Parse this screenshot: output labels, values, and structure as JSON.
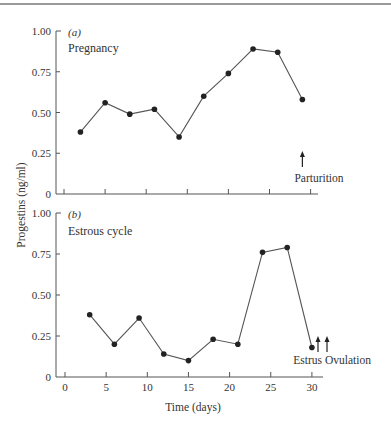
{
  "chart_data": [
    {
      "type": "line",
      "panel_tag": "(a)",
      "title": "Pregnancy",
      "xlabel": "",
      "ylabel": "Progestins (ng/ml)",
      "xlim": [
        0,
        31
      ],
      "ylim": [
        0,
        1.0
      ],
      "x_ticks": [
        0,
        5,
        10,
        15,
        20,
        25,
        30
      ],
      "y_ticks": [
        "0",
        "0.25",
        "0.50",
        "0.75",
        "1.00"
      ],
      "grid": false,
      "x": [
        2,
        5,
        8,
        11,
        14,
        17,
        20,
        23,
        26,
        29
      ],
      "values": [
        0.38,
        0.56,
        0.49,
        0.52,
        0.35,
        0.6,
        0.74,
        0.89,
        0.87,
        0.58
      ],
      "annotations": [
        {
          "label": "Parturition",
          "x": 29,
          "type": "arrow-up"
        }
      ]
    },
    {
      "type": "line",
      "panel_tag": "(b)",
      "title": "Estrous cycle",
      "xlabel": "Time (days)",
      "ylabel": "Progestins (ng/ml)",
      "xlim": [
        0,
        31
      ],
      "ylim": [
        0,
        1.0
      ],
      "x_ticks": [
        0,
        5,
        10,
        15,
        20,
        25,
        30
      ],
      "x_tick_labels": [
        "0",
        "5",
        "10",
        "15",
        "20",
        "25",
        "30"
      ],
      "y_ticks": [
        "0",
        "0.25",
        "0.50",
        "0.75",
        "1.00"
      ],
      "grid": false,
      "x": [
        3,
        6,
        9,
        12,
        15,
        18,
        21,
        24,
        27,
        30
      ],
      "values": [
        0.38,
        0.2,
        0.36,
        0.14,
        0.1,
        0.23,
        0.2,
        0.76,
        0.79,
        0.18
      ],
      "annotations": [
        {
          "label": "Estrus",
          "x": 30.8,
          "type": "arrow-up"
        },
        {
          "label": "Ovulation",
          "x": 32,
          "type": "arrow-up"
        }
      ]
    }
  ],
  "shared": {
    "ylabel": "Progestins (ng/ml)",
    "xlabel": "Time (days)"
  }
}
